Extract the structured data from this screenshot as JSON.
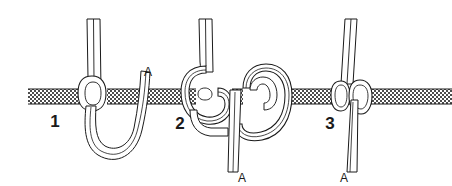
{
  "figure": {
    "type": "line-art-diagram",
    "background_color": "#ffffff",
    "ink_color": "#1a1a1a",
    "rope_fill_color": "#ffffff",
    "bar": {
      "name": "horizontal-bar",
      "texture": "checkerboard-crosshatch",
      "texture_color": "#4d4d4d",
      "texture_background": "#ffffff",
      "x_start": 28,
      "x_end": 452,
      "y_top": 89,
      "y_bottom": 104,
      "thickness_px": 15
    },
    "steps": [
      {
        "number": "1",
        "number_x": 55,
        "number_y": 127,
        "caption": "Pass the working end down behind the bar and bring it back up to form a bight",
        "end_label": "A",
        "end_label_x": 148,
        "end_label_y": 76,
        "rope_strands": 2,
        "loops_around_bar": 1
      },
      {
        "number": "2",
        "number_x": 180,
        "number_y": 129,
        "caption": "Take a second turn so the working end crosses over itself, making two interlocking loops",
        "end_label": "A",
        "end_label_x": 242,
        "end_label_y": 181,
        "rope_strands": 2,
        "loops_around_bar": 2
      },
      {
        "number": "3",
        "number_x": 330,
        "number_y": 129,
        "caption": "Draw the knot tight against the bar; end A hangs straight down",
        "end_label": "A",
        "end_label_x": 344,
        "end_label_y": 181,
        "rope_strands": 2,
        "loops_around_bar": 2
      }
    ],
    "labels": {
      "step_one": "1",
      "step_two": "2",
      "step_three": "3",
      "working_end": "A"
    }
  }
}
